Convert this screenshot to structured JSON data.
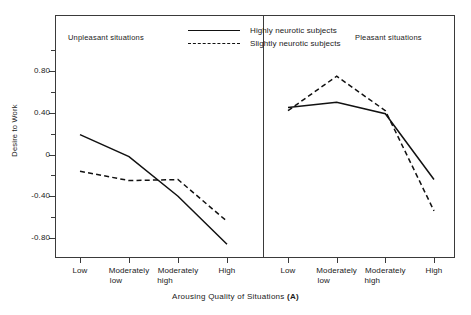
{
  "figure": {
    "y_axis_title": "Desire to Work",
    "x_axis_title_main": "Arousing Quality of Situations",
    "x_axis_title_symbol": "(A)",
    "panel_left_title": "Unpleasant situations",
    "panel_right_title": "Pleasant situations"
  },
  "legend": {
    "position": "top-center",
    "entries": [
      {
        "label": "Highly neurotic subjects",
        "style": "solid"
      },
      {
        "label": "Slightly neurotic subjects",
        "style": "dashed"
      }
    ]
  },
  "y_ticks": [
    {
      "label": "0.80",
      "value": 0.8
    },
    {
      "label": "0.40",
      "value": 0.4
    },
    {
      "label": "0",
      "value": 0
    },
    {
      "label": "-0.40",
      "value": -0.4
    },
    {
      "label": "-0.80",
      "value": -0.8
    }
  ],
  "x_ticks": [
    {
      "line1": "Low",
      "line2": ""
    },
    {
      "line1": "Moderately",
      "line2": "low"
    },
    {
      "line1": "Moderately",
      "line2": "high"
    },
    {
      "line1": "High",
      "line2": ""
    }
  ],
  "chart_data": {
    "type": "line",
    "title": "",
    "xlabel": "Arousing Quality of Situations (A)",
    "ylabel": "Desire to Work",
    "ylim": [
      -1.0,
      1.0
    ],
    "grid": false,
    "legend_position": "top-center",
    "panels": [
      {
        "name": "Unpleasant situations",
        "categories": [
          "Low",
          "Moderately low",
          "Moderately high",
          "High"
        ],
        "series": [
          {
            "name": "Highly neurotic subjects",
            "style": "solid",
            "values": [
              0.19,
              -0.02,
              -0.4,
              -0.86
            ]
          },
          {
            "name": "Slightly neurotic subjects",
            "style": "dashed",
            "values": [
              -0.16,
              -0.25,
              -0.24,
              -0.64
            ]
          }
        ]
      },
      {
        "name": "Pleasant situations",
        "categories": [
          "Low",
          "Moderately low",
          "Moderately high",
          "High"
        ],
        "series": [
          {
            "name": "Highly neurotic subjects",
            "style": "solid",
            "values": [
              0.45,
              0.5,
              0.39,
              -0.24
            ]
          },
          {
            "name": "Slightly neurotic subjects",
            "style": "dashed",
            "values": [
              0.42,
              0.75,
              0.42,
              -0.54
            ]
          }
        ]
      }
    ]
  }
}
